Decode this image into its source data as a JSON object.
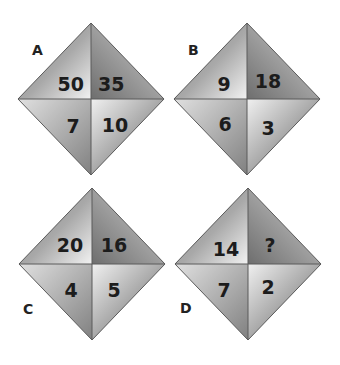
{
  "puzzle": {
    "diamonds": [
      {
        "label": "A",
        "top_left": "50",
        "top_right": "35",
        "bottom_left": "7",
        "bottom_right": "10"
      },
      {
        "label": "B",
        "top_left": "9",
        "top_right": "18",
        "bottom_left": "6",
        "bottom_right": "3"
      },
      {
        "label": "C",
        "top_left": "20",
        "top_right": "16",
        "bottom_left": "4",
        "bottom_right": "5"
      },
      {
        "label": "D",
        "top_left": "14",
        "top_right": "?",
        "bottom_left": "7",
        "bottom_right": "2"
      }
    ]
  },
  "colors": {
    "background": "#ffffff",
    "dark_gray": "#8a8a8a",
    "light_gray": "#ececec",
    "text": "#1c1c1c"
  }
}
